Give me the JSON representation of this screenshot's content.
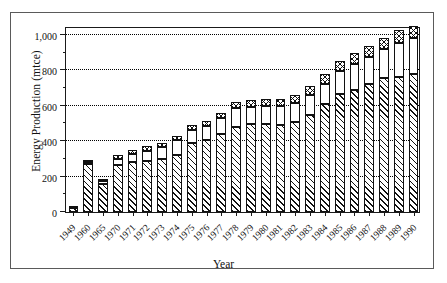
{
  "chart_data": {
    "type": "bar",
    "subtype": "stacked-bar",
    "title": "",
    "xlabel": "Year",
    "ylabel": "Energy Production (mtce)",
    "ylim": [
      0,
      1050
    ],
    "yticks": [
      0,
      200,
      400,
      600,
      800,
      1000
    ],
    "ytick_labels": [
      "0",
      "200",
      "400",
      "600",
      "800",
      "1,000"
    ],
    "yminor_ticks": [
      100,
      300,
      500,
      700,
      900
    ],
    "grid": "horizontal-dotted",
    "legend": "none",
    "categories": [
      "1949",
      "1960",
      "1965",
      "1970",
      "1971",
      "1972",
      "1973",
      "1974",
      "1975",
      "1976",
      "1977",
      "1978",
      "1979",
      "1980",
      "1981",
      "1982",
      "1983",
      "1984",
      "1985",
      "1986",
      "1987",
      "1988",
      "1989",
      "1990"
    ],
    "series": [
      {
        "name": "Coal",
        "pattern": "diagonal-hatch",
        "values": [
          20,
          270,
          160,
          265,
          285,
          290,
          300,
          320,
          390,
          405,
          440,
          480,
          495,
          495,
          490,
          510,
          550,
          610,
          665,
          690,
          720,
          755,
          765,
          780
        ]
      },
      {
        "name": "Oil and Gas",
        "pattern": "white",
        "values": [
          4,
          15,
          15,
          35,
          45,
          55,
          65,
          85,
          75,
          80,
          90,
          105,
          100,
          105,
          110,
          105,
          110,
          115,
          130,
          145,
          155,
          165,
          190,
          200
        ]
      },
      {
        "name": "Other",
        "pattern": "cross-hatch",
        "values": [
          2,
          10,
          10,
          20,
          20,
          25,
          25,
          25,
          25,
          30,
          30,
          35,
          40,
          40,
          40,
          45,
          50,
          55,
          55,
          60,
          60,
          65,
          70,
          70
        ]
      }
    ],
    "totals": [
      26,
      295,
      185,
      320,
      350,
      370,
      390,
      430,
      490,
      515,
      560,
      620,
      635,
      640,
      640,
      660,
      710,
      780,
      850,
      895,
      935,
      985,
      1025,
      1050
    ]
  }
}
